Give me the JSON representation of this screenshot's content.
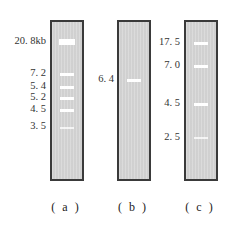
{
  "figure": {
    "lanes": [
      {
        "id": "a",
        "caption": "( a )",
        "bands": [
          {
            "label": "20. 8kb",
            "size_kb": 20.8
          },
          {
            "label": "7. 2",
            "size_kb": 7.2
          },
          {
            "label": "5. 4",
            "size_kb": 5.4
          },
          {
            "label": "5. 2",
            "size_kb": 5.2
          },
          {
            "label": "4. 5",
            "size_kb": 4.5
          },
          {
            "label": "3. 5",
            "size_kb": 3.5
          }
        ]
      },
      {
        "id": "b",
        "caption": "( b )",
        "bands": [
          {
            "label": "6. 4",
            "size_kb": 6.4
          }
        ]
      },
      {
        "id": "c",
        "caption": "( c )",
        "bands": [
          {
            "label": "17. 5",
            "size_kb": 17.5
          },
          {
            "label": "7. 0",
            "size_kb": 7.0
          },
          {
            "label": "4. 5",
            "size_kb": 4.5
          },
          {
            "label": "2. 5",
            "size_kb": 2.5
          }
        ]
      }
    ]
  }
}
